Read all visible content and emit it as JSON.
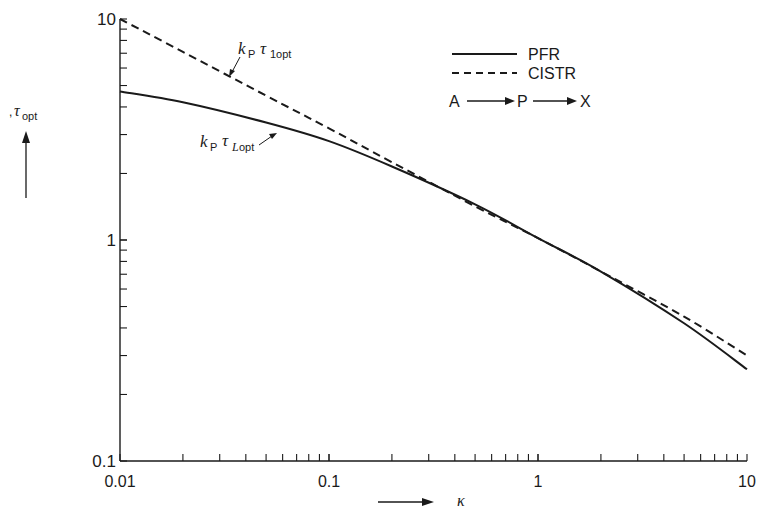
{
  "chart_data": {
    "type": "line",
    "title": "",
    "xlabel": "κ",
    "ylabel": "τ_opt",
    "xscale": "log",
    "yscale": "log",
    "xlim": [
      0.01,
      10
    ],
    "ylim": [
      0.1,
      10
    ],
    "x_ticks": [
      "0.01",
      "0.1",
      "1",
      "10"
    ],
    "y_ticks": [
      "0.1",
      "1",
      "10"
    ],
    "grid": false,
    "legend_position": "upper right",
    "legend": [
      {
        "label": "PFR",
        "style": "solid"
      },
      {
        "label": "CISTR",
        "style": "dashed"
      }
    ],
    "reaction_scheme": "A → P → X",
    "annotations": [
      {
        "text": "kP τ1opt",
        "target": "CISTR"
      },
      {
        "text": "kP τLopt",
        "target": "PFR"
      }
    ],
    "series": [
      {
        "name": "PFR (kP τLopt)",
        "style": "solid",
        "x": [
          0.01,
          0.02,
          0.05,
          0.1,
          0.2,
          0.5,
          1,
          2,
          5,
          10
        ],
        "values": [
          4.7,
          4.2,
          3.4,
          2.8,
          2.15,
          1.45,
          1.02,
          0.72,
          0.42,
          0.26
        ]
      },
      {
        "name": "CISTR (kP τ1opt)",
        "style": "dashed",
        "x": [
          0.01,
          0.02,
          0.05,
          0.1,
          0.2,
          0.5,
          1,
          2,
          5,
          10
        ],
        "values": [
          10,
          7.1,
          4.5,
          3.2,
          2.25,
          1.42,
          1.02,
          0.72,
          0.45,
          0.3
        ]
      }
    ]
  },
  "labels": {
    "y_axis": ", τopt",
    "x_axis": "κ",
    "legend_pfr": "PFR",
    "legend_cistr": "CISTR",
    "scheme_a": "A",
    "scheme_p": "P",
    "scheme_x": "X"
  }
}
